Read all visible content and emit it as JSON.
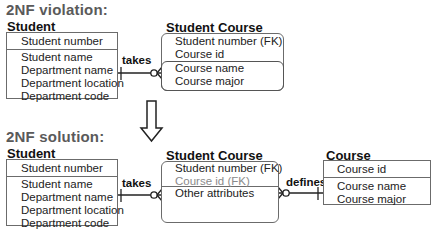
{
  "violation": {
    "title": "2NF violation:",
    "student": {
      "title": "Student",
      "key": "Student number",
      "attributes": [
        "Student name",
        "Department name",
        "Department location",
        "Department code"
      ]
    },
    "relationship": "takes",
    "student_course": {
      "title": "Student Course",
      "keys": [
        "Student number (FK)",
        "Course id"
      ],
      "attributes": [
        "Course name",
        "Course major"
      ]
    }
  },
  "solution": {
    "title": "2NF solution:",
    "student": {
      "title": "Student",
      "key": "Student number",
      "attributes": [
        "Student name",
        "Department name",
        "Department location",
        "Department code"
      ]
    },
    "relationship_left": "takes",
    "student_course": {
      "title": "Student Course",
      "keys": [
        "Student number (FK)",
        "Course id (FK)"
      ],
      "attributes": [
        "Other attributes"
      ]
    },
    "relationship_right": "defines",
    "course": {
      "title": "Course",
      "key": "Course id",
      "attributes": [
        "Course name",
        "Course major"
      ]
    }
  },
  "colors": {
    "line": "#222222",
    "border": "#6b6b6b",
    "section_title": "#5a5a5a",
    "muted_text": "#8a8a8a"
  }
}
